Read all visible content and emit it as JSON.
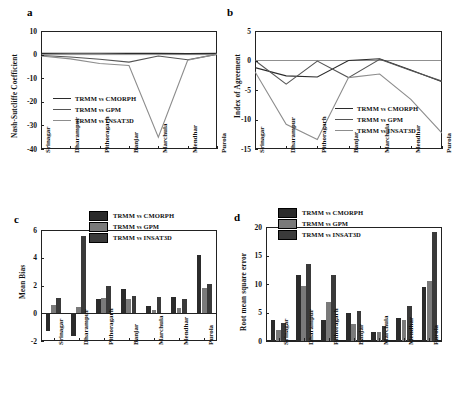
{
  "figure": {
    "panels": [
      "a",
      "b",
      "c",
      "d"
    ],
    "stations": [
      "Srinagar",
      "Dharampur",
      "Pithoragarh",
      "Banjar",
      "Marchula",
      "Mendhar",
      "Purola"
    ],
    "series_names": [
      "TRMM vs CMORPH",
      "TRMM vs GPM",
      "TRMM vs INSAT3D"
    ],
    "colors": {
      "cmorph": "#2b2b2b",
      "gpm": "#555555",
      "insat3d": "#8d8d8d",
      "axis": "#222222",
      "background": "#ffffff"
    }
  },
  "panel_a": {
    "letter": "a",
    "legend": [
      "TRMM vs CMORPH",
      "TRMM vs GPM",
      "TRMM vs INSAT3D"
    ],
    "yticks": [
      "10",
      "0",
      "-10",
      "-20",
      "-30",
      "-40"
    ],
    "xticks": [
      "Srinagar",
      "Dharampur",
      "Pithoragarh",
      "Banjar",
      "Marchula",
      "Mendhar",
      "Purola"
    ],
    "ylabel": "Nash-Sutcliffe Coefficient"
  },
  "panel_b": {
    "letter": "b",
    "legend": [
      "TRMM vs CMORPH",
      "TRMM vs GPM",
      "TRMM vs INSAT3D"
    ],
    "yticks": [
      "5",
      "0",
      "-5",
      "-10",
      "-15"
    ],
    "xticks": [
      "Srinagar",
      "Dharampur",
      "Pithoragarh",
      "Banjar",
      "Marchula",
      "Mendhar",
      "Purola"
    ],
    "ylabel": "Index of Agreement"
  },
  "panel_c": {
    "letter": "c",
    "legend": [
      "TRMM vs CMORPH",
      "TRMM vs GPM",
      "TRMM vs INSAT3D"
    ],
    "yticks": [
      "6",
      "4",
      "2",
      "0",
      "-2"
    ],
    "xticks": [
      "Srinagar",
      "Dharampur",
      "Pithoragarh",
      "Banjar",
      "Marchula",
      "Mendhar",
      "Purola"
    ],
    "ylabel": "Mean Bias"
  },
  "panel_d": {
    "letter": "d",
    "legend": [
      "TRMM vs CMORPH",
      "TRMM vs GPM",
      "TRMM vs INSAT3D"
    ],
    "yticks": [
      "20",
      "15",
      "10",
      "5",
      "0"
    ],
    "xticks": [
      "Srinagar",
      "Dharampur",
      "Pithoragarh",
      "Banjar",
      "Marchula",
      "Mendhar",
      "Purola"
    ],
    "ylabel": "Root mean square error"
  },
  "chart_data": [
    {
      "type": "line",
      "panel": "a",
      "title": "",
      "xlabel": "",
      "ylabel": "Nash-Sutcliffe Coefficient",
      "ylim": [
        -40,
        10
      ],
      "yticks": [
        10,
        0,
        -10,
        -20,
        -30,
        -40
      ],
      "grid": false,
      "legend_position": "center-left",
      "categories": [
        "Srinagar",
        "Dharampur",
        "Pithoragarh",
        "Banjar",
        "Marchula",
        "Mendhar",
        "Purola"
      ],
      "series": [
        {
          "name": "TRMM vs CMORPH",
          "color": "#2b2b2b",
          "values": [
            0.5,
            0.6,
            0.6,
            0.5,
            0.5,
            0.4,
            0.5
          ]
        },
        {
          "name": "TRMM vs GPM",
          "color": "#555555",
          "values": [
            -0.4,
            -1.0,
            -2.0,
            -3.2,
            -0.6,
            -2.2,
            0.1
          ]
        },
        {
          "name": "TRMM vs INSAT3D",
          "color": "#8d8d8d",
          "values": [
            -0.6,
            -1.8,
            -3.8,
            -4.6,
            -35.0,
            -2.4,
            0.2
          ]
        }
      ]
    },
    {
      "type": "line",
      "panel": "b",
      "title": "",
      "xlabel": "",
      "ylabel": "Index of Agreement",
      "ylim": [
        -15,
        5
      ],
      "yticks": [
        5,
        0,
        -5,
        -10,
        -15
      ],
      "grid": false,
      "legend_position": "center-right",
      "categories": [
        "Srinagar",
        "Dharampur",
        "Pithoragarh",
        "Banjar",
        "Marchula",
        "Mendhar",
        "Purola"
      ],
      "series": [
        {
          "name": "TRMM vs CMORPH",
          "color": "#2b2b2b",
          "values": [
            -1.2,
            -2.6,
            -2.8,
            0.0,
            0.3,
            -1.6,
            -3.6
          ]
        },
        {
          "name": "TRMM vs GPM",
          "color": "#555555",
          "values": [
            0.0,
            -4.0,
            -0.1,
            -2.9,
            0.2,
            -1.7,
            -3.5
          ]
        },
        {
          "name": "TRMM vs INSAT3D",
          "color": "#8d8d8d",
          "values": [
            -1.9,
            -10.8,
            -13.4,
            -2.9,
            -2.3,
            -6.6,
            -12.3
          ]
        }
      ]
    },
    {
      "type": "bar",
      "panel": "c",
      "title": "",
      "xlabel": "",
      "ylabel": "Mean Bias",
      "ylim": [
        -2,
        6
      ],
      "yticks": [
        6,
        4,
        2,
        0,
        -2
      ],
      "grid": false,
      "legend_position": "top-center",
      "categories": [
        "Srinagar",
        "Dharampur",
        "Pithoragarh",
        "Banjar",
        "Marchula",
        "Mendhar",
        "Purola"
      ],
      "series": [
        {
          "name": "TRMM vs CMORPH",
          "color": "#2b2b2b",
          "values": [
            -1.25,
            -1.65,
            1.0,
            1.75,
            0.55,
            1.2,
            4.2
          ]
        },
        {
          "name": "TRMM vs GPM",
          "color": "#7a7a7a",
          "values": [
            0.6,
            0.45,
            1.1,
            1.05,
            0.25,
            0.4,
            1.8
          ]
        },
        {
          "name": "TRMM vs INSAT3D",
          "color": "#3a3a3a",
          "values": [
            1.1,
            5.55,
            2.0,
            1.25,
            1.15,
            1.05,
            2.1
          ]
        }
      ]
    },
    {
      "type": "bar",
      "panel": "d",
      "title": "",
      "xlabel": "",
      "ylabel": "Root mean square error",
      "ylim": [
        0,
        20
      ],
      "yticks": [
        20,
        15,
        10,
        5,
        0
      ],
      "grid": false,
      "legend_position": "top-left",
      "categories": [
        "Srinagar",
        "Dharampur",
        "Pithoragarh",
        "Banjar",
        "Marchula",
        "Mendhar",
        "Purola"
      ],
      "series": [
        {
          "name": "TRMM vs CMORPH",
          "color": "#2b2b2b",
          "values": [
            3.7,
            11.6,
            3.7,
            4.9,
            1.6,
            4.0,
            9.5
          ]
        },
        {
          "name": "TRMM vs GPM",
          "color": "#7a7a7a",
          "values": [
            2.0,
            9.7,
            6.8,
            2.9,
            1.5,
            3.7,
            10.6
          ]
        },
        {
          "name": "TRMM vs INSAT3D",
          "color": "#3a3a3a",
          "values": [
            3.1,
            13.5,
            11.6,
            5.2,
            2.6,
            6.1,
            19.1
          ]
        }
      ]
    }
  ]
}
